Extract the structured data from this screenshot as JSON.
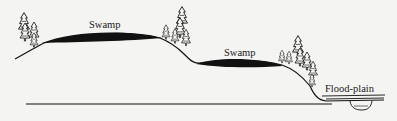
{
  "diagram": {
    "type": "cross-section",
    "labels": {
      "swamp_upper": "Swamp",
      "swamp_lower": "Swamp",
      "floodplain": "Flood-plain"
    },
    "colors": {
      "background": "#f4f4f2",
      "ink": "#111111"
    }
  }
}
